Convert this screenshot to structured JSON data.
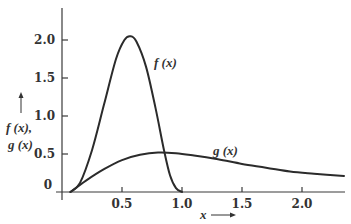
{
  "chart_data": {
    "type": "line",
    "title": "",
    "xlabel": "x",
    "ylabel": "f(x), g(x)",
    "xlim": [
      0,
      2.35
    ],
    "ylim": [
      0,
      2.35
    ],
    "grid": false,
    "legend": "inline labels",
    "x_ticks": [
      0.5,
      1.0,
      1.5,
      2.0
    ],
    "x_tick_labels": [
      "0.5",
      "1.0",
      "1.5",
      "2.0"
    ],
    "y_ticks": [
      0,
      0.5,
      1.0,
      1.5,
      2.0
    ],
    "y_tick_labels": [
      "0",
      "0.5",
      "1.0",
      "1.5",
      "2.0"
    ],
    "series": [
      {
        "name": "f(x)",
        "x": [
          0.07,
          0.15,
          0.25,
          0.35,
          0.45,
          0.52,
          0.57,
          0.62,
          0.7,
          0.78,
          0.85,
          0.9,
          0.95,
          1.0
        ],
        "values": [
          0.0,
          0.12,
          0.55,
          1.15,
          1.75,
          2.0,
          2.05,
          1.98,
          1.65,
          1.1,
          0.55,
          0.22,
          0.05,
          0.0
        ]
      },
      {
        "name": "g(x)",
        "x": [
          0.07,
          0.2,
          0.35,
          0.5,
          0.65,
          0.8,
          0.95,
          1.1,
          1.3,
          1.5,
          1.7,
          1.9,
          2.1,
          2.35
        ],
        "values": [
          0.0,
          0.15,
          0.3,
          0.42,
          0.49,
          0.52,
          0.51,
          0.48,
          0.43,
          0.37,
          0.32,
          0.27,
          0.24,
          0.21
        ]
      }
    ],
    "annotations": [
      {
        "text": "f(x)",
        "x": 0.78,
        "y": 1.7
      },
      {
        "text": "g(x)",
        "x": 1.27,
        "y": 0.52
      },
      {
        "text": "x ⟶",
        "position": "below x-axis"
      },
      {
        "text": "↑ f(x), g(x)",
        "position": "left of y-axis"
      }
    ]
  },
  "labels": {
    "f_curve": "f (x)",
    "g_curve": "g (x)",
    "x_axis": "x",
    "y_axis_line1": "f (x),",
    "y_axis_line2": "g (x)",
    "tick_x_0": "0.5",
    "tick_x_1": "1.0",
    "tick_x_2": "1.5",
    "tick_x_3": "2.0",
    "tick_y_0": "0",
    "tick_y_1": "0.5",
    "tick_y_2": "1.0",
    "tick_y_3": "1.5",
    "tick_y_4": "2.0"
  }
}
